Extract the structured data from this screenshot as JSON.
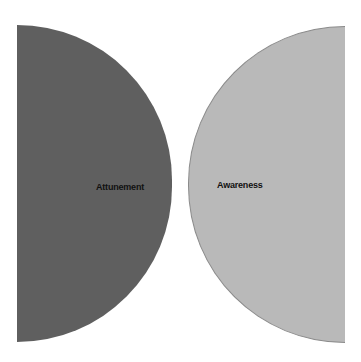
{
  "diagram": {
    "shapes": [
      {
        "name": "left-half-disk",
        "label": "Attunement",
        "color": "#5f5f5f"
      },
      {
        "name": "right-half-disk",
        "label": "Awareness",
        "color": "#b9b9b9"
      }
    ]
  }
}
